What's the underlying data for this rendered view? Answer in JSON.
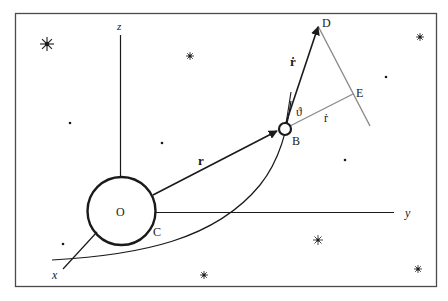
{
  "diagram": {
    "title": "",
    "colors": {
      "ink": "#1a1a1a",
      "gray": "#8a8a8a",
      "frame": "#4a4a4a",
      "background": "#ffffff"
    },
    "axes": {
      "z_label": "z",
      "y_label": "y",
      "x_label": "x"
    },
    "points": {
      "origin": "O",
      "body_point": "C",
      "particle": "B",
      "velocity_tip": "D",
      "projection": "E"
    },
    "vectors": {
      "position": "r",
      "velocity": "ṙ",
      "radial_component": "ṙ",
      "angle": "ϑ"
    },
    "stars": [
      {
        "x": 47,
        "y": 44,
        "size": "large"
      },
      {
        "x": 190,
        "y": 56,
        "size": "small"
      },
      {
        "x": 70,
        "y": 123,
        "size": "tiny"
      },
      {
        "x": 162,
        "y": 143,
        "size": "tiny"
      },
      {
        "x": 420,
        "y": 37,
        "size": "small"
      },
      {
        "x": 386,
        "y": 77,
        "size": "tiny"
      },
      {
        "x": 345,
        "y": 160,
        "size": "tiny"
      },
      {
        "x": 63,
        "y": 244,
        "size": "tiny"
      },
      {
        "x": 318,
        "y": 240,
        "size": "medium"
      },
      {
        "x": 204,
        "y": 275,
        "size": "small"
      },
      {
        "x": 418,
        "y": 269,
        "size": "small"
      }
    ]
  }
}
